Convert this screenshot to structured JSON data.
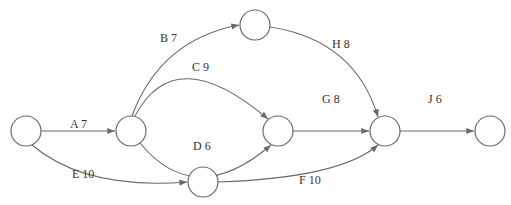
{
  "diagram": {
    "type": "activity-on-arrow network",
    "top_cutoff_text": "",
    "nodes": [
      {
        "id": "n1",
        "cx": 26,
        "cy": 131
      },
      {
        "id": "n2",
        "cx": 131,
        "cy": 131
      },
      {
        "id": "n3",
        "cx": 255,
        "cy": 25
      },
      {
        "id": "n4",
        "cx": 278,
        "cy": 131
      },
      {
        "id": "n5",
        "cx": 385,
        "cy": 131
      },
      {
        "id": "n6",
        "cx": 490,
        "cy": 131
      },
      {
        "id": "n7",
        "cx": 203,
        "cy": 182
      }
    ],
    "node_radius": 15,
    "edges": [
      {
        "activity": "A",
        "duration": 7,
        "label": "A 7",
        "from": "n1",
        "to": "n2"
      },
      {
        "activity": "B",
        "duration": 7,
        "label": "B 7",
        "from": "n2",
        "to": "n3"
      },
      {
        "activity": "C",
        "duration": 9,
        "label": "C 9",
        "from": "n2",
        "to": "n4"
      },
      {
        "activity": "D",
        "duration": 6,
        "label": "D 6",
        "from": "n2",
        "to": "n4"
      },
      {
        "activity": "E",
        "duration": 10,
        "label": "E 10",
        "from": "n1",
        "to": "n7"
      },
      {
        "activity": "F",
        "duration": 10,
        "label": "F 10",
        "from": "n7",
        "to": "n5"
      },
      {
        "activity": "G",
        "duration": 8,
        "label": "G 8",
        "from": "n4",
        "to": "n5"
      },
      {
        "activity": "H",
        "duration": 8,
        "label": "H 8",
        "from": "n3",
        "to": "n5"
      },
      {
        "activity": "J",
        "duration": 6,
        "label": "J 6",
        "from": "n5",
        "to": "n6"
      }
    ],
    "colors": {
      "stroke": "#6a6a6a",
      "text": "#333333",
      "background": "#ffffff"
    }
  }
}
